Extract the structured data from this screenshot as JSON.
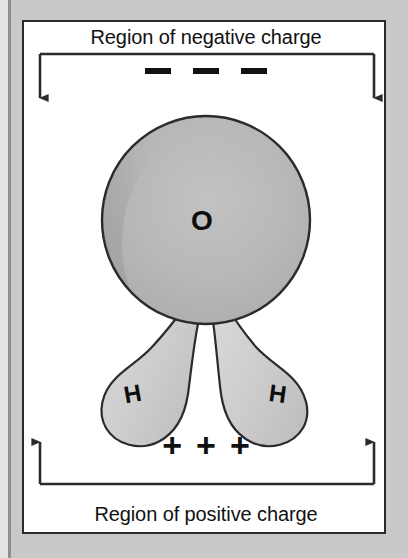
{
  "figure": {
    "background_color": "#c9c9c9",
    "panel_color": "#ffffff",
    "border_color": "#2b2b2b"
  },
  "labels": {
    "top_caption": "Region of negative charge",
    "bottom_caption": "Region of positive charge"
  },
  "charges": {
    "negative_symbol": "–",
    "negative_count": 3,
    "positive_symbol": "+",
    "positive_count": 3,
    "positive_signs": [
      "+",
      "+",
      "+"
    ]
  },
  "molecule": {
    "name": "water",
    "formula": "H2O",
    "atoms": [
      {
        "element": "O",
        "label": "O",
        "role": "oxygen",
        "fill": "#b4b4b4"
      },
      {
        "element": "H",
        "label": "H",
        "role": "hydrogen-left",
        "fill": "#cccccc"
      },
      {
        "element": "H",
        "label": "H",
        "role": "hydrogen-right",
        "fill": "#cccccc"
      }
    ]
  },
  "brackets": {
    "top": {
      "direction": "down",
      "arrow_count": 2
    },
    "bottom": {
      "direction": "up",
      "arrow_count": 2
    }
  }
}
